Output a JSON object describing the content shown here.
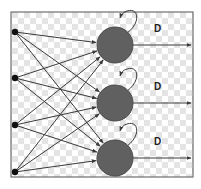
{
  "diagram": {
    "title": "",
    "colors": {
      "frame": "#6f6f6f",
      "checker_light": "#ffffff",
      "checker_dark": "#e4e4e4",
      "edge": "#3a3a3a",
      "input_node": "#111111",
      "neuron_fill": "#606060",
      "neuron_stroke": "#4a4a4a",
      "label": "#222222"
    },
    "frame": {
      "x": 11,
      "y": 12,
      "w": 182,
      "h": 165
    },
    "inputs": [
      {
        "id": "x1",
        "x": 15,
        "y": 32
      },
      {
        "id": "x2",
        "x": 15,
        "y": 78
      },
      {
        "id": "x3",
        "x": 15,
        "y": 125
      },
      {
        "id": "x4",
        "x": 15,
        "y": 172
      }
    ],
    "neurons": [
      {
        "id": "n1",
        "x": 115,
        "y": 45,
        "r": 18,
        "delay_label": "D",
        "label_x": 154,
        "label_y": 32,
        "output_end_x": 191
      },
      {
        "id": "n2",
        "x": 115,
        "y": 103,
        "r": 18,
        "delay_label": "D",
        "label_x": 154,
        "label_y": 90,
        "output_end_x": 191
      },
      {
        "id": "n3",
        "x": 115,
        "y": 158,
        "r": 18,
        "delay_label": "D",
        "label_x": 154,
        "label_y": 145,
        "output_end_x": 191
      }
    ],
    "connections": "fully-connected: each of 4 inputs to each of 3 neurons",
    "self_loop_label": "D"
  }
}
